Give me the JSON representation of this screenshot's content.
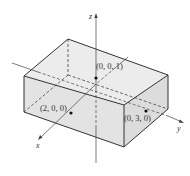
{
  "diagram": {
    "type": "3d-rectangular-box",
    "axes": {
      "x": {
        "label": "x"
      },
      "y": {
        "label": "y"
      },
      "z": {
        "label": "z"
      }
    },
    "points": [
      {
        "label": "(0, 0, 1)"
      },
      {
        "label": "(2, 0, 0)"
      },
      {
        "label": "(0, 3, 0)"
      }
    ],
    "colors": {
      "face_fill": "#e6e6e6",
      "edge": "#333333",
      "axis": "#444444"
    }
  }
}
